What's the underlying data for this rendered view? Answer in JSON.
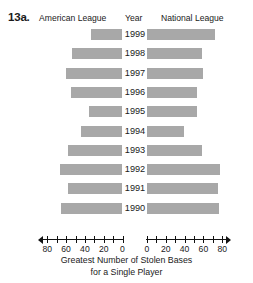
{
  "figure_number": "13a.",
  "header": {
    "left_label": "American League",
    "center_label": "Year",
    "right_label": "National League"
  },
  "axis": {
    "title_line1": "Greatest Number of Stolen Bases",
    "title_line2": "for a Single Player",
    "left_tick_labels": [
      "80",
      "60",
      "40",
      "20",
      "0"
    ],
    "right_tick_labels": [
      "0",
      "20",
      "40",
      "60",
      "80"
    ],
    "max": 80,
    "minor_step": 10,
    "major_step": 20
  },
  "colors": {
    "bar": "#a8a8a8",
    "axis": "#111111",
    "text": "#1a1a1a",
    "background": "#ffffff"
  },
  "chart_data": {
    "type": "bar",
    "orientation": "horizontal-diverging",
    "title": "Greatest Number of Stolen Bases for a Single Player",
    "xlabel": "Greatest Number of Stolen Bases for a Single Player",
    "ylabel": "Year",
    "xlim": [
      0,
      80
    ],
    "grid": false,
    "legend_position": "top",
    "categories": [
      "1999",
      "1998",
      "1997",
      "1996",
      "1995",
      "1994",
      "1993",
      "1992",
      "1991",
      "1990"
    ],
    "series": [
      {
        "name": "American League",
        "side": "left",
        "values": [
          34,
          54,
          60,
          55,
          36,
          44,
          58,
          66,
          58,
          65
        ]
      },
      {
        "name": "National League",
        "side": "right",
        "values": [
          72,
          58,
          60,
          53,
          53,
          39,
          58,
          78,
          76,
          77
        ]
      }
    ],
    "rows": [
      {
        "year": "1999",
        "american_league": 34,
        "national_league": 72
      },
      {
        "year": "1998",
        "american_league": 54,
        "national_league": 58
      },
      {
        "year": "1997",
        "american_league": 60,
        "national_league": 60
      },
      {
        "year": "1996",
        "american_league": 55,
        "national_league": 53
      },
      {
        "year": "1995",
        "american_league": 36,
        "national_league": 53
      },
      {
        "year": "1994",
        "american_league": 44,
        "national_league": 39
      },
      {
        "year": "1993",
        "american_league": 58,
        "national_league": 58
      },
      {
        "year": "1992",
        "american_league": 66,
        "national_league": 78
      },
      {
        "year": "1991",
        "american_league": 58,
        "national_league": 76
      },
      {
        "year": "1990",
        "american_league": 65,
        "national_league": 77
      }
    ]
  }
}
